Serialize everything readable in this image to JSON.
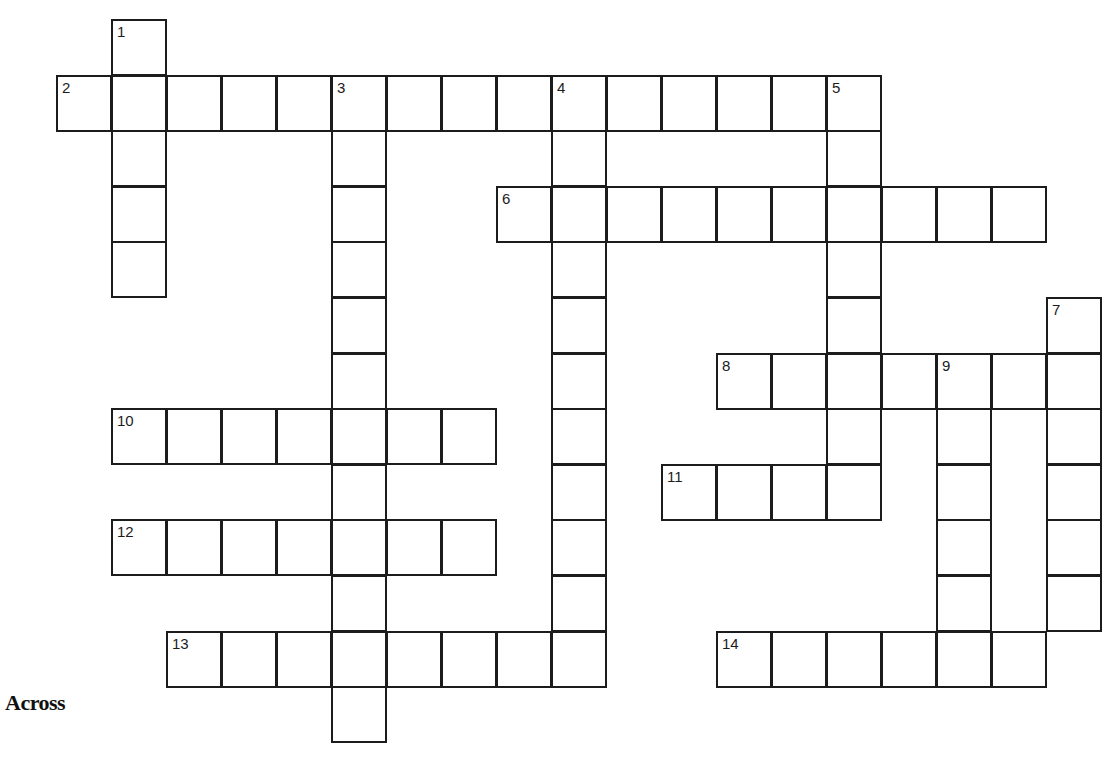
{
  "puzzle": {
    "type": "crossword",
    "cell_px": 55,
    "origin": {
      "x": 56,
      "y": 19
    },
    "row_step": 55.6,
    "line_color": "#1c1c1c",
    "entries": [
      {
        "number": "1",
        "direction": "down",
        "row": 0,
        "col": 1,
        "length": 5
      },
      {
        "number": "2",
        "direction": "across",
        "row": 1,
        "col": 0,
        "length": 15
      },
      {
        "number": "3",
        "direction": "down",
        "row": 1,
        "col": 5,
        "length": 12
      },
      {
        "number": "4",
        "direction": "down",
        "row": 1,
        "col": 9,
        "length": 11
      },
      {
        "number": "5",
        "direction": "down",
        "row": 1,
        "col": 14,
        "length": 8
      },
      {
        "number": "6",
        "direction": "across",
        "row": 3,
        "col": 8,
        "length": 10
      },
      {
        "number": "7",
        "direction": "down",
        "row": 5,
        "col": 18,
        "length": 6
      },
      {
        "number": "8",
        "direction": "across",
        "row": 6,
        "col": 12,
        "length": 7
      },
      {
        "number": "9",
        "direction": "down",
        "row": 6,
        "col": 16,
        "length": 5
      },
      {
        "number": "10",
        "direction": "across",
        "row": 7,
        "col": 1,
        "length": 7
      },
      {
        "number": "11",
        "direction": "across",
        "row": 8,
        "col": 11,
        "length": 4
      },
      {
        "number": "12",
        "direction": "across",
        "row": 9,
        "col": 1,
        "length": 7
      },
      {
        "number": "13",
        "direction": "across",
        "row": 11,
        "col": 2,
        "length": 8
      },
      {
        "number": "14",
        "direction": "across",
        "row": 11,
        "col": 12,
        "length": 6
      }
    ]
  },
  "clues": {
    "across_heading": "Across"
  }
}
